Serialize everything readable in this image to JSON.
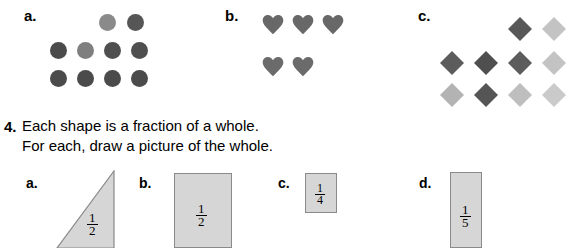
{
  "top_sections": [
    {
      "label": "a.",
      "shape": "circle",
      "label_pos": {
        "x": 24,
        "y": 8
      },
      "items": [
        {
          "x": 99,
          "y": 14,
          "color": "#8a8a8a"
        },
        {
          "x": 127,
          "y": 14,
          "color": "#565656"
        },
        {
          "x": 50,
          "y": 42,
          "color": "#4b4b4b"
        },
        {
          "x": 77,
          "y": 42,
          "color": "#7f7f7f"
        },
        {
          "x": 104,
          "y": 42,
          "color": "#4f4f4f"
        },
        {
          "x": 131,
          "y": 42,
          "color": "#4f4f4f"
        },
        {
          "x": 50,
          "y": 70,
          "color": "#4b4b4b"
        },
        {
          "x": 77,
          "y": 70,
          "color": "#4b4b4b"
        },
        {
          "x": 104,
          "y": 70,
          "color": "#4b4b4b"
        },
        {
          "x": 131,
          "y": 70,
          "color": "#4b4b4b"
        }
      ]
    },
    {
      "label": "b.",
      "shape": "heart",
      "label_pos": {
        "x": 225,
        "y": 8
      },
      "items": [
        {
          "x": 262,
          "y": 14,
          "color": "#686868"
        },
        {
          "x": 292,
          "y": 14,
          "color": "#686868"
        },
        {
          "x": 322,
          "y": 14,
          "color": "#686868"
        },
        {
          "x": 262,
          "y": 56,
          "color": "#6b6b6b"
        },
        {
          "x": 292,
          "y": 56,
          "color": "#6b6b6b"
        }
      ]
    },
    {
      "label": "c.",
      "shape": "diamond",
      "label_pos": {
        "x": 418,
        "y": 8
      },
      "items": [
        {
          "x": 508,
          "y": 17,
          "color": "#585858"
        },
        {
          "x": 542,
          "y": 17,
          "color": "#c3c3c3"
        },
        {
          "x": 440,
          "y": 51,
          "color": "#5c5c5c"
        },
        {
          "x": 474,
          "y": 51,
          "color": "#4f4f4f"
        },
        {
          "x": 508,
          "y": 51,
          "color": "#5c5c5c"
        },
        {
          "x": 542,
          "y": 51,
          "color": "#c3c3c3"
        },
        {
          "x": 440,
          "y": 83,
          "color": "#b3b3b3"
        },
        {
          "x": 474,
          "y": 83,
          "color": "#555555"
        },
        {
          "x": 508,
          "y": 83,
          "color": "#bebebe"
        },
        {
          "x": 542,
          "y": 83,
          "color": "#cacaca"
        }
      ]
    }
  ],
  "problem": {
    "number": "4.",
    "lines": [
      "Each shape is a fraction of a whole.",
      "For each, draw a picture of the whole."
    ]
  },
  "fraction_items": [
    {
      "label": "a.",
      "label_pos": {
        "x": 26,
        "y": 176
      },
      "figure": "triangle",
      "rect": {
        "x": 56,
        "y": 170,
        "w": 60,
        "h": 78
      },
      "fraction": {
        "numerator": "1",
        "denominator": "2"
      },
      "frac_pos": {
        "x": 87,
        "y": 212
      }
    },
    {
      "label": "b.",
      "label_pos": {
        "x": 139,
        "y": 176
      },
      "figure": "rectangle",
      "rect": {
        "x": 174,
        "y": 173,
        "w": 58,
        "h": 75
      },
      "fraction": {
        "numerator": "1",
        "denominator": "2"
      },
      "frac_pos": {
        "x": 196,
        "y": 203
      }
    },
    {
      "label": "c.",
      "label_pos": {
        "x": 278,
        "y": 176
      },
      "figure": "rectangle",
      "rect": {
        "x": 305,
        "y": 173,
        "w": 32,
        "h": 40
      },
      "fraction": {
        "numerator": "1",
        "denominator": "4"
      },
      "frac_pos": {
        "x": 315,
        "y": 183
      }
    },
    {
      "label": "d.",
      "label_pos": {
        "x": 419,
        "y": 176
      },
      "figure": "rectangle",
      "rect": {
        "x": 450,
        "y": 172,
        "w": 32,
        "h": 76
      },
      "fraction": {
        "numerator": "1",
        "denominator": "5"
      },
      "frac_pos": {
        "x": 460,
        "y": 204
      }
    }
  ],
  "colors": {
    "shape_fill": "#d6d6d6",
    "shape_stroke": "#8a8a8a",
    "text": "#000000"
  }
}
